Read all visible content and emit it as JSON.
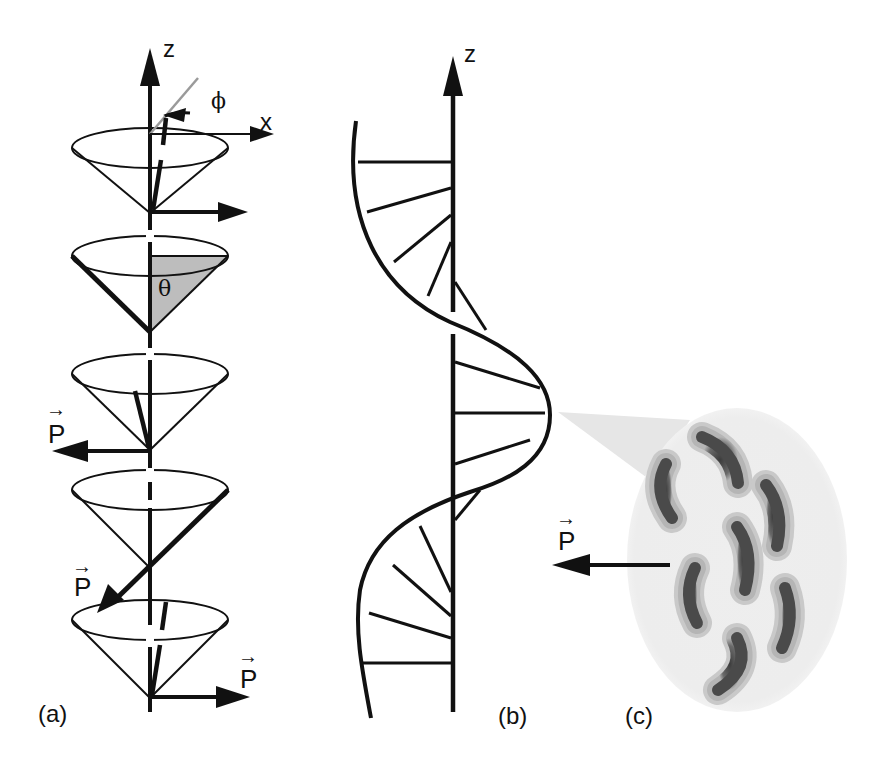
{
  "figure": {
    "panels": [
      {
        "id": "a",
        "label": "(a)",
        "description": "Precessing cones of dipole direction along z axis",
        "axis_labels": {
          "z": "z",
          "x": "x"
        },
        "angles": {
          "azimuth": "ϕ",
          "polar": "θ"
        },
        "vector_label": "P",
        "vector_arrow_glyph": "→"
      },
      {
        "id": "b",
        "label": "(b)",
        "description": "Helical rotation of polarization along z",
        "axis_labels": {
          "z": "z"
        }
      },
      {
        "id": "c",
        "label": "(c)",
        "description": "Magnified layer of bent-core molecules with net polarization",
        "vector_label": "P",
        "vector_arrow_glyph": "→",
        "molecule_count": 7
      }
    ],
    "colors": {
      "ink": "#111111",
      "shade": "#bdbdbd",
      "phi_line": "#9a9a9a",
      "blob": "#ececec",
      "molecule": "#555555"
    }
  }
}
